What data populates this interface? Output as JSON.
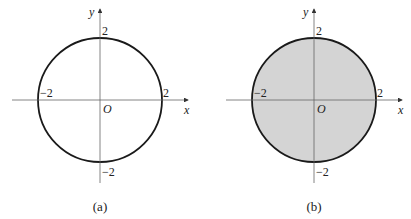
{
  "figures": [
    {
      "id": "a",
      "caption": "(a)",
      "shaded": false,
      "axis_x_label": "x",
      "axis_y_label": "y",
      "origin_label": "O",
      "tick_labels": {
        "x_pos": "2",
        "x_neg": "−2",
        "y_pos": "2",
        "y_neg": "−2"
      },
      "description": "Circle x² + y² = 4 (boundary only)"
    },
    {
      "id": "b",
      "caption": "(b)",
      "shaded": true,
      "axis_x_label": "x",
      "axis_y_label": "y",
      "origin_label": "O",
      "tick_labels": {
        "x_pos": "2",
        "x_neg": "−2",
        "y_pos": "2",
        "y_neg": "−2"
      },
      "description": "Disk x² + y² ≤ 4 (shaded interior)"
    }
  ],
  "colors": {
    "stroke": "#1a1a1a",
    "axis": "#555555",
    "fill_b": "#d4d4d4"
  }
}
